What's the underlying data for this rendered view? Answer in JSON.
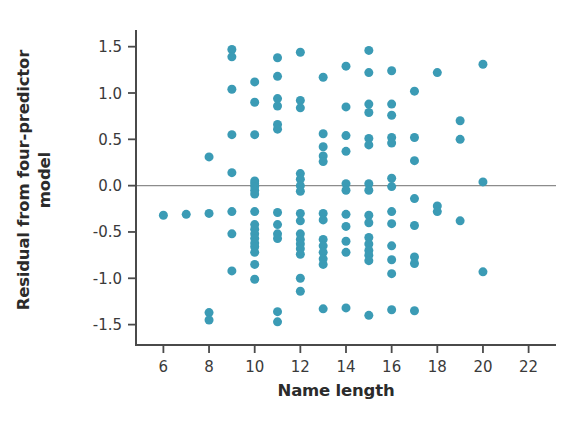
{
  "chart_data": {
    "type": "scatter",
    "title": "",
    "xlabel": "Name length",
    "ylabel": "Residual from four-predictor model",
    "ylabel_line1": "Residual from four-predictor",
    "ylabel_line2": "model",
    "xlim": [
      4.8,
      23.2
    ],
    "ylim": [
      -1.72,
      1.68
    ],
    "xticks": [
      6,
      8,
      10,
      12,
      14,
      16,
      18,
      20,
      22
    ],
    "xtick_labels": [
      "6",
      "8",
      "10",
      "12",
      "14",
      "16",
      "18",
      "20",
      "22"
    ],
    "yticks": [
      1.5,
      1.0,
      0.5,
      0.0,
      -0.5,
      -1.0,
      -1.5
    ],
    "ytick_labels": [
      "1.5",
      "1.0",
      "0.5",
      "0.0",
      "-0.5",
      "-1.0",
      "-1.5"
    ],
    "grid": false,
    "legend": null,
    "reference_line": {
      "axis": "y",
      "value": 0.0,
      "color": "#8c8c8c"
    },
    "marker": {
      "color": "#3b9bb5",
      "size": 9,
      "shape": "circle"
    },
    "spines": {
      "left": true,
      "bottom": true,
      "top": false,
      "right": false
    },
    "points": [
      [
        6,
        -0.32
      ],
      [
        7,
        -0.31
      ],
      [
        8,
        0.31
      ],
      [
        8,
        -0.3
      ],
      [
        8,
        -1.37
      ],
      [
        8,
        -1.45
      ],
      [
        9,
        1.47
      ],
      [
        9,
        1.39
      ],
      [
        9,
        1.04
      ],
      [
        9,
        0.55
      ],
      [
        9,
        0.14
      ],
      [
        9,
        -0.28
      ],
      [
        9,
        -0.52
      ],
      [
        9,
        -0.92
      ],
      [
        10,
        1.12
      ],
      [
        10,
        0.9
      ],
      [
        10,
        0.55
      ],
      [
        10,
        0.05
      ],
      [
        10,
        0.02
      ],
      [
        10,
        -0.01
      ],
      [
        10,
        -0.05
      ],
      [
        10,
        -0.09
      ],
      [
        10,
        -0.28
      ],
      [
        10,
        -0.42
      ],
      [
        10,
        -0.47
      ],
      [
        10,
        -0.52
      ],
      [
        10,
        -0.57
      ],
      [
        10,
        -0.62
      ],
      [
        10,
        -0.66
      ],
      [
        10,
        -0.72
      ],
      [
        10,
        -0.85
      ],
      [
        10,
        -1.01
      ],
      [
        11,
        1.38
      ],
      [
        11,
        1.18
      ],
      [
        11,
        0.94
      ],
      [
        11,
        0.86
      ],
      [
        11,
        0.66
      ],
      [
        11,
        0.61
      ],
      [
        11,
        -0.29
      ],
      [
        11,
        -0.42
      ],
      [
        11,
        -0.52
      ],
      [
        11,
        -0.57
      ],
      [
        11,
        -1.36
      ],
      [
        11,
        -1.47
      ],
      [
        12,
        1.44
      ],
      [
        12,
        0.92
      ],
      [
        12,
        0.84
      ],
      [
        12,
        0.13
      ],
      [
        12,
        0.07
      ],
      [
        12,
        0.0
      ],
      [
        12,
        -0.06
      ],
      [
        12,
        -0.3
      ],
      [
        12,
        -0.38
      ],
      [
        12,
        -0.52
      ],
      [
        12,
        -0.58
      ],
      [
        12,
        -0.63
      ],
      [
        12,
        -0.68
      ],
      [
        12,
        -0.74
      ],
      [
        12,
        -1.0
      ],
      [
        12,
        -1.14
      ],
      [
        13,
        1.17
      ],
      [
        13,
        0.56
      ],
      [
        13,
        0.42
      ],
      [
        13,
        0.32
      ],
      [
        13,
        0.26
      ],
      [
        13,
        -0.3
      ],
      [
        13,
        -0.37
      ],
      [
        13,
        -0.58
      ],
      [
        13,
        -0.65
      ],
      [
        13,
        -0.72
      ],
      [
        13,
        -0.79
      ],
      [
        13,
        -0.85
      ],
      [
        13,
        -1.33
      ],
      [
        14,
        1.29
      ],
      [
        14,
        0.85
      ],
      [
        14,
        0.54
      ],
      [
        14,
        0.37
      ],
      [
        14,
        0.02
      ],
      [
        14,
        -0.05
      ],
      [
        14,
        -0.31
      ],
      [
        14,
        -0.44
      ],
      [
        14,
        -0.6
      ],
      [
        14,
        -0.72
      ],
      [
        14,
        -1.32
      ],
      [
        15,
        1.46
      ],
      [
        15,
        1.22
      ],
      [
        15,
        0.88
      ],
      [
        15,
        0.79
      ],
      [
        15,
        0.51
      ],
      [
        15,
        0.44
      ],
      [
        15,
        0.02
      ],
      [
        15,
        -0.05
      ],
      [
        15,
        -0.32
      ],
      [
        15,
        -0.4
      ],
      [
        15,
        -0.56
      ],
      [
        15,
        -0.63
      ],
      [
        15,
        -0.7
      ],
      [
        15,
        -0.75
      ],
      [
        15,
        -0.81
      ],
      [
        15,
        -1.4
      ],
      [
        16,
        1.24
      ],
      [
        16,
        0.88
      ],
      [
        16,
        0.76
      ],
      [
        16,
        0.52
      ],
      [
        16,
        0.46
      ],
      [
        16,
        0.08
      ],
      [
        16,
        -0.01
      ],
      [
        16,
        -0.28
      ],
      [
        16,
        -0.41
      ],
      [
        16,
        -0.65
      ],
      [
        16,
        -0.8
      ],
      [
        16,
        -0.95
      ],
      [
        16,
        -1.34
      ],
      [
        17,
        1.02
      ],
      [
        17,
        0.52
      ],
      [
        17,
        0.27
      ],
      [
        17,
        -0.14
      ],
      [
        17,
        -0.43
      ],
      [
        17,
        -0.77
      ],
      [
        17,
        -0.84
      ],
      [
        17,
        -1.35
      ],
      [
        18,
        1.22
      ],
      [
        18,
        -0.22
      ],
      [
        18,
        -0.28
      ],
      [
        19,
        0.7
      ],
      [
        19,
        0.5
      ],
      [
        19,
        -0.38
      ],
      [
        20,
        1.31
      ],
      [
        20,
        0.04
      ],
      [
        20,
        -0.93
      ]
    ]
  }
}
